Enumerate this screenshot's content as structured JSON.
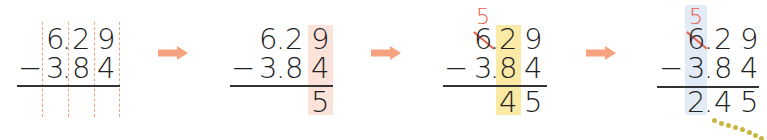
{
  "problem": {
    "minuend": "6.29",
    "subtrahend": "3.84",
    "operator": "−",
    "difference": "2.45"
  },
  "colors": {
    "arrow": "#f6a27e",
    "guide_dash": "#f0a27f",
    "borrow_red": "#e8604f",
    "hl_ones": "#fbe3da",
    "hl_tenths": "#fbeaa6",
    "hl_units": "#e3ecf6",
    "dotted_trail": "#c8b740"
  },
  "steps": [
    {
      "label": "align digits",
      "top": [
        "6",
        ".",
        "2",
        "9"
      ],
      "bottom": [
        "−",
        "3",
        ".",
        "8",
        "4"
      ],
      "result": []
    },
    {
      "label": "subtract hundredths",
      "top": [
        "6",
        ".",
        "2",
        "9"
      ],
      "bottom": [
        "−",
        "3",
        ".",
        "8",
        "4"
      ],
      "result": [
        "5"
      ]
    },
    {
      "label": "borrow and subtract tenths",
      "borrow": "5",
      "top": [
        "6",
        ".",
        "2",
        "9"
      ],
      "bottom": [
        "−",
        "3",
        ".",
        "8",
        "4"
      ],
      "result": [
        "4",
        "5"
      ]
    },
    {
      "label": "subtract ones",
      "borrow": "5",
      "top": [
        "6",
        ".",
        "2",
        "9"
      ],
      "bottom": [
        "−",
        "3",
        ".",
        "8",
        "4"
      ],
      "result": [
        "2",
        ".",
        "4",
        "5"
      ]
    }
  ],
  "arrows": [
    "arrow-right",
    "arrow-right",
    "arrow-right"
  ]
}
